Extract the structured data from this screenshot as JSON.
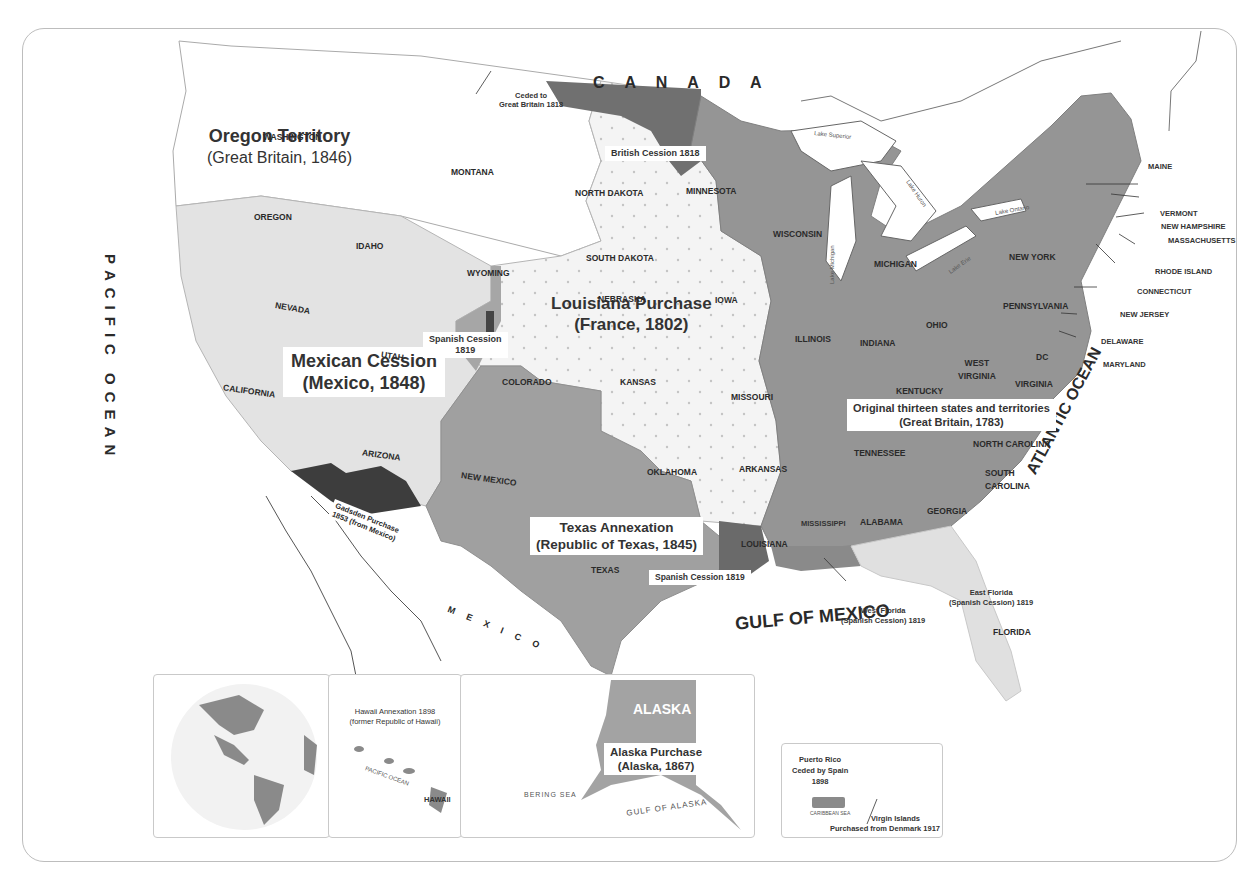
{
  "map": {
    "title_fragment": "                                               ",
    "colors": {
      "original_territory": "#8f8f8f",
      "louisiana_purchase": "#f4f4f4",
      "louisiana_dots": "#c9c9c9",
      "mexican_cession": "#e3e3e3",
      "texas_annexation": "#9c9c9c",
      "oregon_territory": "#ffffff",
      "british_cession": "#6e6e6e",
      "gadsden_purchase": "#3d3d3d",
      "florida_cessions": "#dedede",
      "water": "#ffffff",
      "border": "#bdbdbd"
    },
    "regions": [
      {
        "id": "oregon",
        "title": "Oregon Territory",
        "subtitle": "(Great Britain, 1846)"
      },
      {
        "id": "louisiana",
        "title": "Louisiana Purchase",
        "subtitle": "(France, 1802)"
      },
      {
        "id": "mexican",
        "title": "Mexican Cession",
        "subtitle": "(Mexico, 1848)"
      },
      {
        "id": "texas",
        "title": "Texas Annexation",
        "subtitle": "(Republic of Texas, 1845)"
      },
      {
        "id": "original",
        "title": "Original thirteen states and territories",
        "subtitle": "(Great Britain, 1783)"
      }
    ],
    "small_labels": {
      "ceded_gb": [
        "Ceded to",
        "Great Britain 1818"
      ],
      "british_cession": "British Cession 1818",
      "spanish_cession_co": [
        "Spanish Cession",
        "1819"
      ],
      "spanish_cession_la": "Spanish Cession 1819",
      "gadsden": [
        "Gadsden Purchase",
        "1853 (from Mexico)"
      ],
      "west_florida": [
        "West Florida",
        "(Spanish Cession) 1819"
      ],
      "east_florida": [
        "East Florida",
        "(Spanish Cession) 1819"
      ]
    },
    "water_labels": {
      "canada": "C A N A D A",
      "pacific": "PACIFIC OCEAN",
      "atlantic": "ATLANTIC OCEAN",
      "gulf": "GULF OF MEXICO",
      "mexico": "M E X I C O",
      "lake_superior": "Lake Superior",
      "lake_michigan": "Lake Michigan",
      "lake_huron": "Lake Huron",
      "lake_erie": "Lake Erie",
      "lake_ontario": "Lake Ontario"
    },
    "states": {
      "washington": "WASHINGTON",
      "oregon": "OREGON",
      "idaho": "IDAHO",
      "montana": "MONTANA",
      "wyoming": "WYOMING",
      "north_dakota": "NORTH DAKOTA",
      "south_dakota": "SOUTH DAKOTA",
      "minnesota": "MINNESOTA",
      "nebraska": "NEBRASKA",
      "iowa": "IOWA",
      "nevada": "NEVADA",
      "utah": "UTAH",
      "colorado": "COLORADO",
      "kansas": "KANSAS",
      "california": "CALIFORNIA",
      "arizona": "ARIZONA",
      "new_mexico": "NEW MEXICO",
      "oklahoma": "OKLAHOMA",
      "texas": "TEXAS",
      "missouri": "MISSOURI",
      "arkansas": "ARKANSAS",
      "louisiana": "LOUISIANA",
      "wisconsin": "WISCONSIN",
      "michigan": "MICHIGAN",
      "illinois": "ILLINOIS",
      "indiana": "INDIANA",
      "ohio": "OHIO",
      "kentucky": "KENTUCKY",
      "tennessee": "TENNESSEE",
      "mississippi": "MISSISSIPPI",
      "alabama": "ALABAMA",
      "georgia": "GEORGIA",
      "florida": "FLORIDA",
      "south_carolina": [
        "SOUTH",
        "CAROLINA"
      ],
      "north_carolina": "NORTH CAROLINA",
      "virginia": "VIRGINIA",
      "west_virginia": [
        "WEST",
        "VIRGINIA"
      ],
      "dc": "DC",
      "pennsylvania": "PENNSYLVANIA",
      "new_york": "NEW YORK",
      "maine": "MAINE",
      "vermont": "VERMONT",
      "new_hampshire": "NEW HAMPSHIRE",
      "massachusetts": "MASSACHUSETTS",
      "rhode_island": "RHODE ISLAND",
      "connecticut": "CONNECTICUT",
      "new_jersey": "NEW JERSEY",
      "delaware": "DELAWARE",
      "maryland": "MARYLAND"
    },
    "insets": {
      "globe": {
        "labels": [
          "NORTH AMERICA",
          "ATLANTIC OCEAN",
          "PACIFIC OCEAN",
          "HAWAII"
        ]
      },
      "hawaii": {
        "title": [
          "Hawaii Annexation 1898",
          "(former Republic of Hawaii)"
        ],
        "sea": "PACIFIC OCEAN",
        "label": "HAWAII"
      },
      "alaska": {
        "label": "ALASKA",
        "title": [
          "Alaska Purchase",
          "(Alaska, 1867)"
        ],
        "sea1": "BERING SEA",
        "sea2": "GULF OF ALASKA"
      },
      "puerto_rico": {
        "title": [
          "Puerto Rico",
          "Ceded by Spain",
          "1898"
        ],
        "sea": "CARIBBEAN SEA",
        "vi": [
          "Virgin Islands",
          "Purchased from Denmark 1917"
        ]
      }
    }
  }
}
